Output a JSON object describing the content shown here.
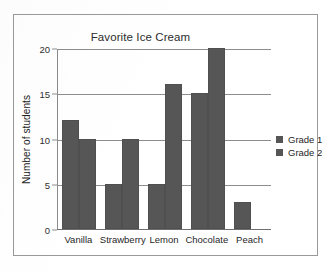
{
  "chart_data": {
    "type": "bar",
    "title": "Favorite Ice Cream",
    "xlabel": "",
    "ylabel": "Number of students",
    "categories": [
      "Vanilla",
      "Strawberry",
      "Lemon",
      "Chocolate",
      "Peach"
    ],
    "series": [
      {
        "name": "Grade 1",
        "values": [
          12,
          5,
          5,
          15,
          3
        ],
        "color": "#565656"
      },
      {
        "name": "Grade 2",
        "values": [
          10,
          10,
          16,
          20,
          0
        ],
        "color": "#565656"
      }
    ],
    "ylim": [
      0,
      20
    ],
    "ytick_labels": [
      "0",
      "5",
      "10",
      "15",
      "20"
    ],
    "ytick_values": [
      0,
      5,
      10,
      15,
      20
    ],
    "grid": true,
    "grid_axis": "y",
    "legend_position": "right",
    "legend_entries": [
      "Grade 1",
      "Grade 2"
    ],
    "frame_color": "#9a9a9a",
    "grid_color": "#8d8d8d",
    "background": "#ffffff"
  }
}
